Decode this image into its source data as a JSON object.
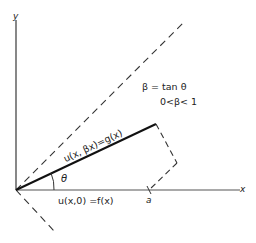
{
  "diagram": {
    "axes": {
      "x_label": "x",
      "y_label": "y"
    },
    "labels": {
      "beta_def": "β = tan θ",
      "beta_range": "0<β< 1",
      "upper_line": "u(x, βx)=g(x)",
      "lower_line": "u(x,0)  =f(x)",
      "angle": "θ",
      "point_a": "a"
    },
    "colors": {
      "stroke": "#222222",
      "axis": "#555555"
    }
  }
}
